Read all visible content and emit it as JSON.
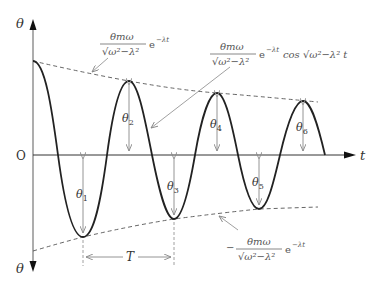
{
  "diagram": {
    "axes": {
      "y_label_top": "θ",
      "y_label_bottom": "θ",
      "x_label": "t",
      "origin_label": "O"
    },
    "amplitudes": {
      "theta1": {
        "sym": "θ",
        "sub": "1"
      },
      "theta2": {
        "sym": "θ",
        "sub": "2"
      },
      "theta3": {
        "sym": "θ",
        "sub": "3"
      },
      "theta4": {
        "sym": "θ",
        "sub": "4"
      },
      "theta5": {
        "sym": "θ",
        "sub": "5"
      },
      "theta6": {
        "sym": "θ",
        "sub": "6"
      }
    },
    "period_label": "T",
    "upper_envelope_formula": {
      "numerator": "θmω",
      "denominator": "√ω²−λ²",
      "exp": "e",
      "exp_power": "−λt"
    },
    "curve_formula": {
      "numerator": "θmω",
      "denominator": "√ω²−λ²",
      "exp": "e",
      "exp_power": "−λt",
      "tail": "cos √ω²−λ² t"
    },
    "lower_envelope_formula": {
      "sign": "−",
      "numerator": "θmω",
      "denominator": "√ω²−λ²",
      "exp": "e",
      "exp_power": "−λt"
    }
  }
}
